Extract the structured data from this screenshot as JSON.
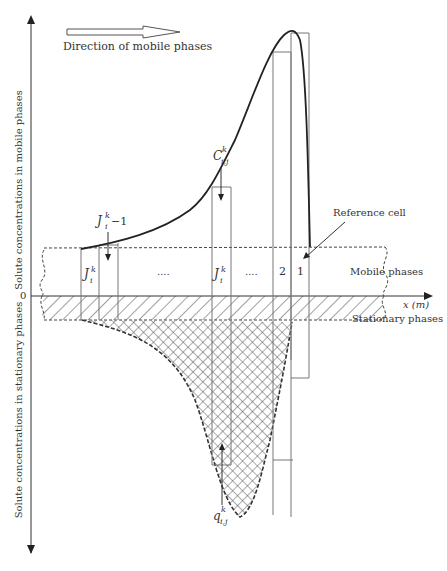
{
  "direction_label": "Direction of mobile phases",
  "y_axis_upper_label": "Solute concentrations in mobile phases",
  "y_axis_lower_label": "Solute concentrations in stationary phases",
  "origin_label": "0",
  "x_axis_label": "x (m)",
  "region_labels": {
    "mobile": "Mobile phases",
    "stationary": "Stationary phases"
  },
  "reference_cell_label": "Reference cell",
  "cells": {
    "cell_1": "1",
    "cell_2": "2",
    "ellipsis_left": "....",
    "ellipsis_right": "...."
  },
  "math_labels": {
    "J_prev": {
      "base": "J",
      "sup": "k",
      "sub": "i",
      "suffix": "−1"
    },
    "J_first": {
      "base": "J",
      "sup": "k",
      "sub": "i"
    },
    "J_mid": {
      "base": "J",
      "sup": "k",
      "sub": "i"
    },
    "C": {
      "base": "C",
      "sup": "k",
      "sub": "i,j"
    },
    "q": {
      "base": "q",
      "sup": "k",
      "sub": "i,j"
    }
  },
  "colors": {
    "curve": "#222222",
    "lines": "#777777",
    "hatch": "#444444",
    "background": "#ffffff"
  }
}
